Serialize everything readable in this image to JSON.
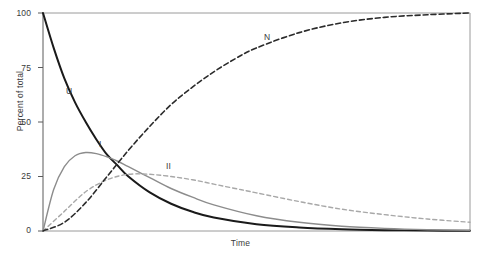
{
  "chart_data": {
    "type": "line",
    "title": "",
    "xlabel": "Time",
    "ylabel": "Percent of total",
    "ylim": [
      0,
      100
    ],
    "xlim": [
      0,
      10
    ],
    "yticks": [
      0,
      25,
      50,
      75,
      100
    ],
    "ytick_labels": [
      "0",
      "25",
      "50",
      "75",
      "100"
    ],
    "xticks": [],
    "xtick_labels": [],
    "grid": false,
    "legend_position": "inline-annotations",
    "frame": {
      "left": 43,
      "top": 13,
      "right": 470,
      "bottom": 231
    },
    "series": [
      {
        "name": "U",
        "label": "U",
        "style": "solid",
        "color": "#1a1a1a",
        "width": 2.0,
        "label_x": 66,
        "label_y": 86,
        "description": "Unfolded fraction, exponential decay from 100 to 0",
        "x": [
          0,
          0.25,
          0.5,
          0.75,
          1,
          1.25,
          1.5,
          1.75,
          2,
          2.5,
          3,
          3.5,
          4,
          5,
          6,
          7,
          8,
          9,
          10
        ],
        "values": [
          100,
          84,
          70,
          59,
          50,
          42,
          35,
          30,
          25,
          17.7,
          12.5,
          8.8,
          6.2,
          3.1,
          1.6,
          0.8,
          0.4,
          0.2,
          0.1
        ]
      },
      {
        "name": "I",
        "label": "I",
        "style": "solid",
        "color": "#8c8c8c",
        "width": 1.4,
        "label_x": 99,
        "label_y": 139,
        "description": "Intermediate I, rises to peak ~36 percent then decays",
        "x": [
          0,
          0.25,
          0.5,
          0.75,
          1,
          1.25,
          1.5,
          1.75,
          2,
          2.5,
          3,
          3.5,
          4,
          5,
          6,
          7,
          8,
          9,
          10
        ],
        "values": [
          0,
          19,
          29.5,
          34.5,
          36,
          35.5,
          34,
          32,
          29.5,
          24.5,
          19.5,
          15.5,
          12,
          7,
          4,
          2.2,
          1.2,
          0.6,
          0.3
        ]
      },
      {
        "name": "II",
        "label": "II",
        "style": "dashed",
        "color": "#a8a8a8",
        "width": 1.4,
        "label_x": 166,
        "label_y": 161,
        "description": "Intermediate II, rises to peak ~26 percent then slowly decays",
        "x": [
          0,
          0.5,
          1,
          1.5,
          2,
          2.5,
          3,
          3.5,
          4,
          4.5,
          5,
          6,
          7,
          8,
          9,
          10
        ],
        "values": [
          0,
          9,
          18,
          23.5,
          26,
          26,
          25,
          23.5,
          21.5,
          19.5,
          17.5,
          13.5,
          10,
          7.5,
          5.5,
          4
        ]
      },
      {
        "name": "N",
        "label": "N",
        "style": "dashed",
        "color": "#2b2b2b",
        "width": 1.6,
        "label_x": 264,
        "label_y": 32,
        "description": "Native state, sigmoidal rise from 0 to 100 percent",
        "x": [
          0,
          0.5,
          1,
          1.5,
          2,
          2.5,
          3,
          3.5,
          4,
          4.5,
          5,
          6,
          7,
          8,
          9,
          10
        ],
        "values": [
          0,
          4,
          13,
          25,
          37,
          48,
          58,
          66,
          73,
          79,
          84,
          91,
          95.5,
          98,
          99.2,
          100
        ]
      }
    ]
  },
  "axes": {
    "ylabel": "Percent of total",
    "xlabel": "Time"
  }
}
